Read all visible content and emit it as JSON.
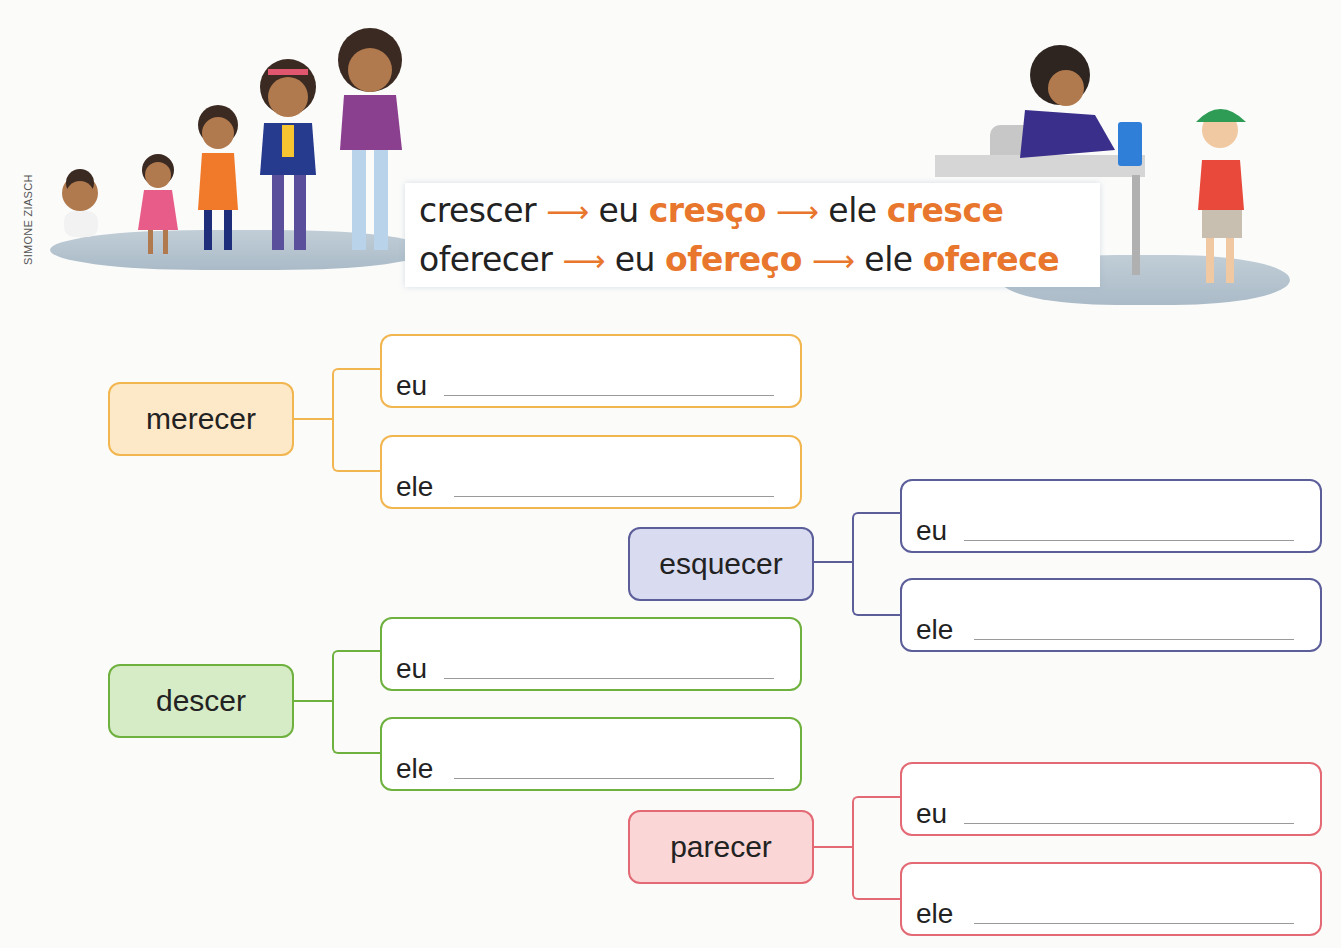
{
  "credit": "SIMONE ZIASCH",
  "examples": [
    {
      "verb": "crescer",
      "arrow": "⟶",
      "eu_label": "eu",
      "eu_form": "cresço",
      "ele_label": "ele",
      "ele_form": "cresce"
    },
    {
      "verb": "oferecer",
      "arrow": "⟶",
      "eu_label": "eu",
      "eu_form": "ofereço",
      "ele_label": "ele",
      "ele_form": "oferece"
    }
  ],
  "exercises": [
    {
      "verb": "merecer",
      "color": "#f2b650",
      "fill": "#fde9c8",
      "eu_label": "eu",
      "ele_label": "ele",
      "eu_value": "",
      "ele_value": ""
    },
    {
      "verb": "esquecer",
      "color": "#5c5e9a",
      "fill": "#d9dbf0",
      "eu_label": "eu",
      "ele_label": "ele",
      "eu_value": "",
      "ele_value": ""
    },
    {
      "verb": "descer",
      "color": "#6fb13f",
      "fill": "#d6ecc6",
      "eu_label": "eu",
      "ele_label": "ele",
      "eu_value": "",
      "ele_value": ""
    },
    {
      "verb": "parecer",
      "color": "#e36a74",
      "fill": "#fad6d6",
      "eu_label": "eu",
      "ele_label": "ele",
      "eu_value": "",
      "ele_value": ""
    }
  ],
  "colors": {
    "highlight": "#e8762d"
  }
}
